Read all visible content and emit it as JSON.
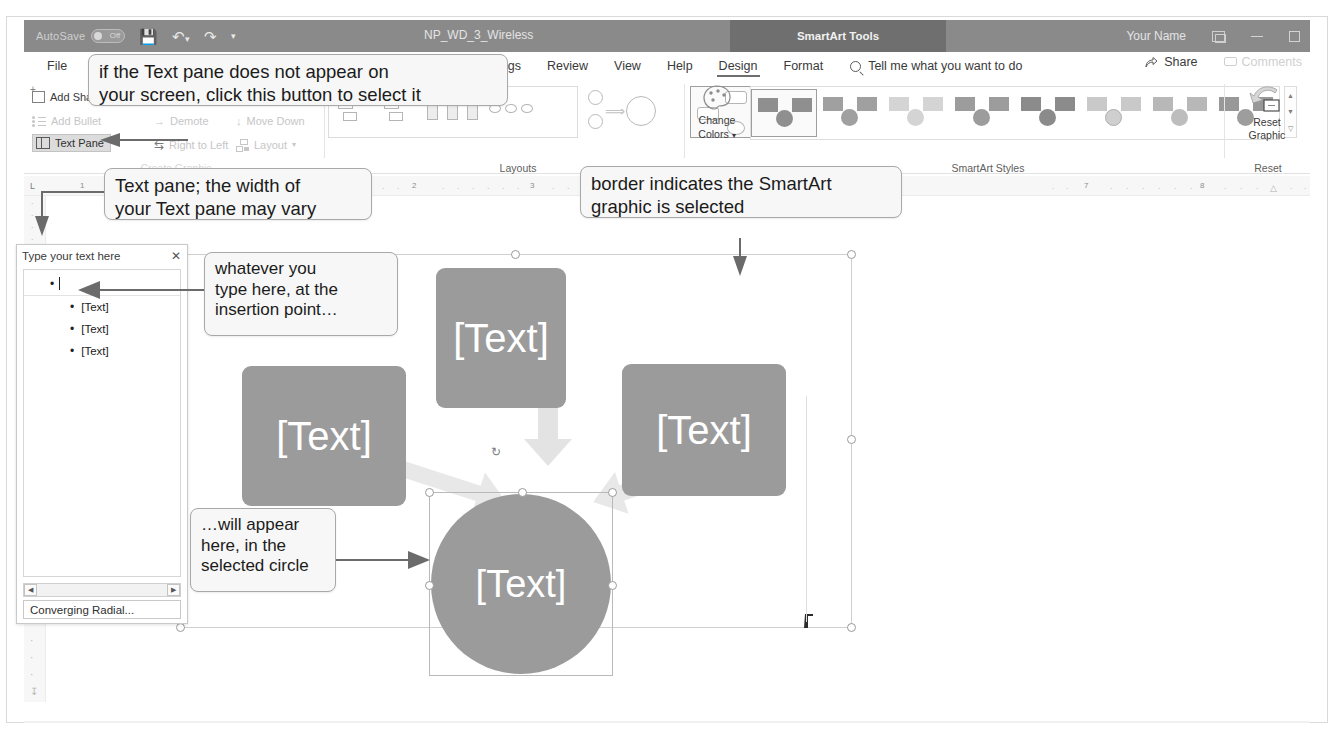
{
  "titlebar": {
    "autosave_label": "AutoSave",
    "autosave_state": "Off",
    "quick_access": [
      "save-icon",
      "undo-icon",
      "redo-icon",
      "customize-qat-icon"
    ],
    "document_title": "NP_WD_3_Wireless",
    "contextual_tab_title": "SmartArt Tools",
    "user_name": "Your Name",
    "window_buttons": [
      "ribbon-display-options",
      "minimize",
      "restore"
    ]
  },
  "ribbon": {
    "tabs": [
      {
        "label": "File",
        "active": false
      },
      {
        "label": "Mailings",
        "active": false
      },
      {
        "label": "Review",
        "active": false
      },
      {
        "label": "View",
        "active": false
      },
      {
        "label": "Help",
        "active": false
      },
      {
        "label": "Design",
        "active": true
      },
      {
        "label": "Format",
        "active": false
      }
    ],
    "tell_me": "Tell me what you want to do",
    "share_label": "Share",
    "comments_label": "Comments",
    "groups": [
      {
        "name": "create-graphic",
        "label": "Create Graphic"
      },
      {
        "name": "layouts",
        "label": "Layouts"
      },
      {
        "name": "smartart-styles",
        "label": "SmartArt Styles"
      },
      {
        "name": "reset",
        "label": "Reset"
      }
    ],
    "create_graphic": {
      "add_shape": "Add Shape",
      "add_bullet": "Add Bullet",
      "text_pane": "Text Pane",
      "promote": "Promote",
      "demote": "Demote",
      "move_up": "Move Up",
      "move_down": "Move Down",
      "right_to_left": "Right to Left",
      "layout": "Layout"
    },
    "reset": {
      "reset_graphic_line1": "Reset",
      "reset_graphic_line2": "Graphic"
    },
    "change_colors": {
      "line1": "Change",
      "line2": "Colors"
    }
  },
  "ruler": {
    "h_numbers": [
      "1",
      "2",
      "3",
      "7",
      "8"
    ],
    "left_tab_marker": "L"
  },
  "text_pane": {
    "title": "Type your text here",
    "close_label": "✕",
    "entries": [
      "",
      "[Text]",
      "[Text]",
      "[Text]"
    ],
    "footer_label": "Converging Radial...",
    "scroll_left": "◀",
    "scroll_right": "▶"
  },
  "smartart": {
    "shapes": [
      {
        "id": "top",
        "label": "[Text]"
      },
      {
        "id": "left",
        "label": "[Text]"
      },
      {
        "id": "right",
        "label": "[Text]"
      },
      {
        "id": "center-circle",
        "label": "[Text]",
        "selected": true
      }
    ]
  },
  "callouts": [
    {
      "name": "text-pane-button-callout",
      "text": "if the Text pane does not appear on\nyour screen, click this button to select it"
    },
    {
      "name": "text-pane-width-callout",
      "text": "Text pane; the width of\nyour Text pane may vary"
    },
    {
      "name": "border-selected-callout",
      "text": "border indicates the SmartArt\ngraphic is selected"
    },
    {
      "name": "insertion-point-callout",
      "text": "whatever you\ntype here, at the\ninsertion point…"
    },
    {
      "name": "selected-circle-callout",
      "text": "…will appear\nhere, in the\nselected circle"
    }
  ],
  "colors": {
    "titlebar": "#8a8a8a",
    "contextual_tab": "#6f6f6f",
    "shape_fill": "#9b9b9b",
    "callout_fill": "#f7f7f7",
    "ribbon_bg": "#ffffff"
  }
}
